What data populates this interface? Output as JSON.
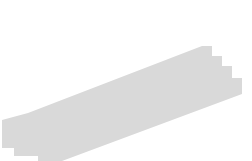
{
  "canvas": {
    "width": 252,
    "height": 161,
    "background": "#ffffff",
    "title": "Diagonal shaded band with coordinate axes, steep line and horizontal bar"
  },
  "colors": {
    "band_fill": "#d9d9d9",
    "band_edge": "#1a1a1a",
    "axis": "#9a9a9a",
    "steep_line": "#1a1a1a",
    "thick_gray_segment": "#8a8a8a",
    "black_bar": "#000000",
    "dashed_drop": "#1a1a1a"
  },
  "axes": {
    "x_axis": {
      "name": "horizontal-axis",
      "x1": 15,
      "y1": 88,
      "x2": 243,
      "y2": 88,
      "stroke_width": 1.2,
      "arrow": "right"
    },
    "y_axis": {
      "name": "vertical-axis",
      "x1": 120,
      "y1": 154,
      "x2": 120,
      "y2": 9,
      "stroke_width": 1.2,
      "arrow": "up"
    }
  },
  "band": {
    "name": "shaded-strip",
    "description": "light gray diagonal strip with stepped (staircase) ends",
    "slope": 0.385,
    "upper_edge": {
      "x1": 8,
      "y1": 112,
      "x2": 228,
      "y2": 27
    },
    "lower_edge": {
      "x1": 22,
      "y1": 152,
      "x2": 244,
      "y2": 66
    },
    "outline_polygon": "8,112 8,112 228,27 228,27 244,66 22,152",
    "fill_polygon_points": "2,120 2,148 14,148 14,156 38,156 38,161 62,161 242,94 242,78 232,78 232,66 222,66 222,56 212,56 212,46 202,46 28,113",
    "edge_dash_pattern": "4 3",
    "edge_solid_fraction_start": 0.18,
    "edge_solid_fraction_end": 0.82
  },
  "steep_line": {
    "name": "steep-diagonal-line",
    "x1": 95,
    "y1": 33,
    "x2": 152,
    "y2": 143,
    "stroke_width": 1.6
  },
  "gray_segment": {
    "name": "thick-gray-segment",
    "x1": 108,
    "y1": 58,
    "x2": 133,
    "y2": 112,
    "stroke_width": 4.5
  },
  "black_bar": {
    "name": "horizontal-black-bar",
    "x": 108,
    "y": 85,
    "width": 25,
    "height": 5
  },
  "dashed_segments": [
    {
      "name": "dashed-drop-left",
      "x1": 108,
      "y1": 59,
      "x2": 108,
      "y2": 85,
      "dash": "3 2.5",
      "stroke_width": 1.1
    },
    {
      "name": "dashed-drop-right",
      "x1": 133,
      "y1": 90,
      "x2": 133,
      "y2": 113,
      "dash": "3 2.5",
      "stroke_width": 1.1
    }
  ]
}
